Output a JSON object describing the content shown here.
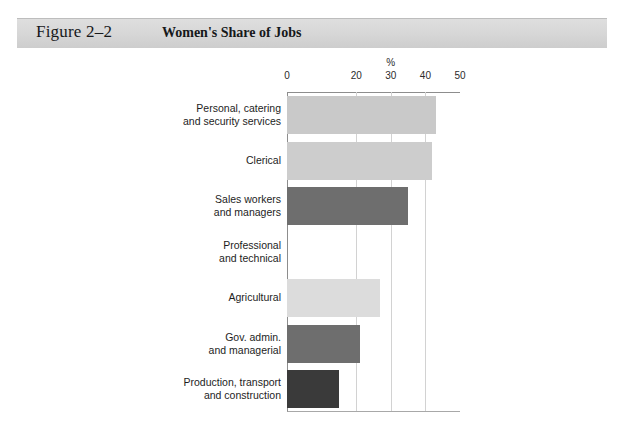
{
  "header": {
    "figure_number": "Figure 2–2",
    "title": "Women's Share of Jobs"
  },
  "chart_data": {
    "type": "bar",
    "orientation": "horizontal",
    "title": "Women's Share of Jobs",
    "xlabel": "%",
    "ylabel": "",
    "xlim": [
      0,
      50
    ],
    "xticks": [
      0,
      20,
      30,
      40,
      50
    ],
    "xtick_labels": [
      "0",
      "20",
      "30",
      "40",
      "50"
    ],
    "grid": true,
    "grid_axis": "x",
    "legend": "none",
    "categories": [
      "Personal, catering and security services",
      "Clerical",
      "Sales workers and managers",
      "Professional and technical",
      "Agricultural",
      "Gov. admin. and managerial",
      "Production, transport and construction"
    ],
    "values": [
      43,
      42,
      35,
      0,
      27,
      21,
      15
    ],
    "bar_colors": [
      "#c9c9c9",
      "#cdcdcd",
      "#6e6e6e",
      "#ffffff",
      "#dcdcdc",
      "#6e6e6e",
      "#3a3a3a"
    ]
  },
  "categories": [
    {
      "line1": "Personal, catering",
      "line2": "and security services",
      "value": 43,
      "color": "#c9c9c9"
    },
    {
      "line1": "Clerical",
      "line2": "",
      "value": 42,
      "color": "#cdcdcd"
    },
    {
      "line1": "Sales workers",
      "line2": "and managers",
      "value": 35,
      "color": "#6e6e6e"
    },
    {
      "line1": "Professional",
      "line2": "and technical",
      "value": 0,
      "color": "#ffffff"
    },
    {
      "line1": "Agricultural",
      "line2": "",
      "value": 27,
      "color": "#dcdcdc"
    },
    {
      "line1": "Gov. admin.",
      "line2": "and managerial",
      "value": 21,
      "color": "#6e6e6e"
    },
    {
      "line1": "Production, transport",
      "line2": "and construction",
      "value": 15,
      "color": "#3a3a3a"
    }
  ],
  "axis": {
    "percent_symbol": "%",
    "ticks": [
      {
        "label": "0",
        "value": 0
      },
      {
        "label": "20",
        "value": 20
      },
      {
        "label": "30",
        "value": 30
      },
      {
        "label": "40",
        "value": 40
      },
      {
        "label": "50",
        "value": 50
      }
    ]
  }
}
